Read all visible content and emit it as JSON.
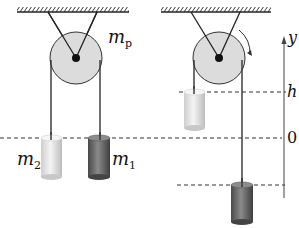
{
  "figure": {
    "left_panel": {
      "pulley_label": "m",
      "pulley_label_sub": "p",
      "mass2_label": "m",
      "mass2_label_sub": "2",
      "mass1_label": "m",
      "mass1_label_sub": "1"
    },
    "right_panel": {
      "axis_label": "y",
      "level_h": "h",
      "level_0": "0"
    },
    "colors": {
      "pulley_fill": "#dcdcdc",
      "mass1_fill": "#6e6e6e",
      "mass2_fill": "#e4e4e4",
      "line": "#222222"
    }
  }
}
